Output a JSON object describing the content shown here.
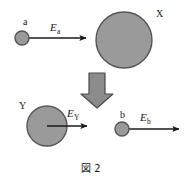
{
  "figure": {
    "caption": "図 2",
    "width": 187,
    "height": 183,
    "background_color": "#ffffff",
    "sphere_fill_color": "#9a9a9a",
    "sphere_stroke_color": "#555555",
    "arrow_color": "#1a1a1a",
    "block_arrow_fill_color": "#8c8c8c",
    "block_arrow_stroke_color": "#4a4a4a",
    "top_row": {
      "small_sphere": {
        "label": "a",
        "cx": 22,
        "cy": 38,
        "r": 7
      },
      "field_arrow": {
        "label_symbol": "E",
        "label_subscript": "a",
        "x_start": 22,
        "x_end": 88,
        "y": 38
      },
      "large_sphere": {
        "label": "X",
        "cx": 124,
        "cy": 40,
        "r": 28
      }
    },
    "transition_arrow": {
      "name": "downward-block-arrow",
      "cx": 97,
      "y_top": 73,
      "y_bottom": 108
    },
    "bottom_row": {
      "large_sphere": {
        "label": "Y",
        "cx": 47,
        "cy": 126,
        "r": 20
      },
      "large_sphere_field_arrow": {
        "label_symbol": "E",
        "label_subscript": "Y",
        "x_start": 47,
        "x_end": 89,
        "y": 126
      },
      "small_sphere": {
        "label": "b",
        "cx": 122,
        "cy": 129,
        "r": 7
      },
      "small_sphere_field_arrow": {
        "label_symbol": "E",
        "label_subscript": "b",
        "x_start": 122,
        "x_end": 181,
        "y": 129
      }
    }
  }
}
